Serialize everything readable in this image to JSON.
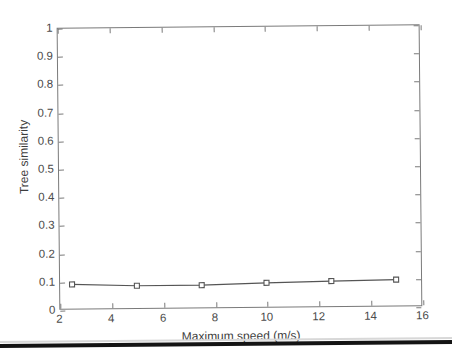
{
  "figure": {
    "name": "tree-similarity-vs-maximum-speed",
    "background_color": "#ffffff",
    "axis_color": "#7a7a7a",
    "text_color": "#4a4a4a",
    "series_color": "#555555",
    "marker_fill": "#ffffff",
    "scan_artifact_color": "#141414"
  },
  "chart_data": {
    "type": "line",
    "title": "",
    "subtitle": "",
    "xlabel": "Maximum speed (m/s)",
    "ylabel": "Tree similarity",
    "xlim": [
      2,
      16
    ],
    "ylim": [
      0,
      1
    ],
    "grid": false,
    "legend": null,
    "legend_position": "none",
    "xticks": [
      2,
      4,
      6,
      8,
      10,
      12,
      14,
      16
    ],
    "xtick_labels": [
      "2",
      "4",
      "6",
      "8",
      "10",
      "12",
      "14",
      "16"
    ],
    "yticks": [
      0,
      0.1,
      0.2,
      0.3,
      0.4,
      0.5,
      0.6,
      0.7,
      0.8,
      0.9,
      1
    ],
    "ytick_labels": [
      "0",
      "0.1",
      "0.2",
      "0.3",
      "0.4",
      "0.5",
      "0.6",
      "0.7",
      "0.8",
      "0.9",
      "1"
    ],
    "marker": "square-open",
    "x": [
      2.5,
      5,
      7.5,
      10,
      12.5,
      15
    ],
    "values": [
      0.089,
      0.082,
      0.082,
      0.088,
      0.092,
      0.095
    ],
    "annotations": []
  }
}
